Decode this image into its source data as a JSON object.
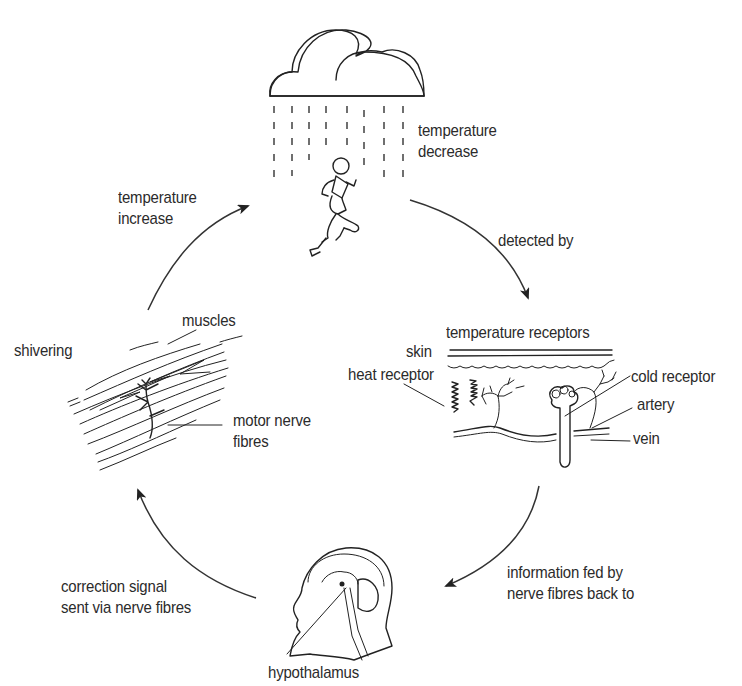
{
  "diagram": {
    "type": "cycle",
    "colors": {
      "ink": "#222222",
      "text": "#2b2b2b",
      "background": "#ffffff"
    },
    "stages": {
      "stimulus": {
        "icon": "rain-cloud-runner-icon",
        "label_line1": "temperature",
        "label_line2": "decrease"
      },
      "receptors": {
        "icon": "skin-cross-section-icon",
        "title": "temperature receptors",
        "labels": {
          "skin": "skin",
          "heat_receptor": "heat receptor",
          "cold_receptor": "cold receptor",
          "artery": "artery",
          "vein": "vein"
        }
      },
      "control_centre": {
        "icon": "head-brain-icon",
        "label": "hypothalamus"
      },
      "effector": {
        "icon": "muscle-fibres-icon",
        "labels": {
          "shivering": "shivering",
          "muscles": "muscles",
          "motor_nerve_line1": "motor nerve",
          "motor_nerve_line2": "fibres"
        }
      }
    },
    "arrows": [
      {
        "from": "stimulus",
        "to": "receptors",
        "line1": "detected by",
        "line2": ""
      },
      {
        "from": "receptors",
        "to": "control_centre",
        "line1": "information fed by",
        "line2": "nerve fibres back to"
      },
      {
        "from": "control_centre",
        "to": "effector",
        "line1": "correction signal",
        "line2": "sent via nerve fibres"
      },
      {
        "from": "effector",
        "to": "stimulus",
        "line1": "temperature",
        "line2": "increase"
      }
    ]
  }
}
